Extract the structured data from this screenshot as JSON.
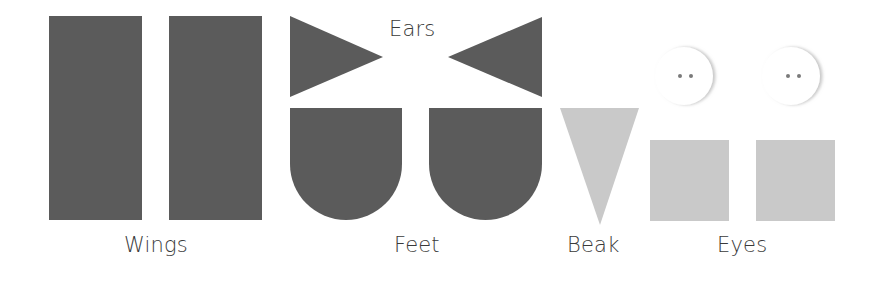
{
  "colors": {
    "dark_piece": "#5b5b5b",
    "light_piece": "#c9c9c9",
    "button_face": "#ffffff",
    "button_shadow": "#d4d4d4",
    "button_holes": "#7a7a7a",
    "label_text": "#3a3a3a"
  },
  "groups": {
    "wings": {
      "label": "Wings",
      "pieces": [
        "rectangle",
        "rectangle"
      ],
      "color": "dark"
    },
    "ears": {
      "label": "Ears",
      "pieces": [
        "triangle-pointing-right",
        "triangle-pointing-left"
      ],
      "color": "dark"
    },
    "feet": {
      "label": "Feet",
      "pieces": [
        "rounded-bottom-shape",
        "rounded-bottom-shape"
      ],
      "color": "dark"
    },
    "beak": {
      "label": "Beak",
      "pieces": [
        "inverted-triangle"
      ],
      "color": "light"
    },
    "eyes": {
      "label": "Eyes",
      "pieces": [
        "square",
        "square",
        "button",
        "button"
      ],
      "color": "light"
    }
  }
}
